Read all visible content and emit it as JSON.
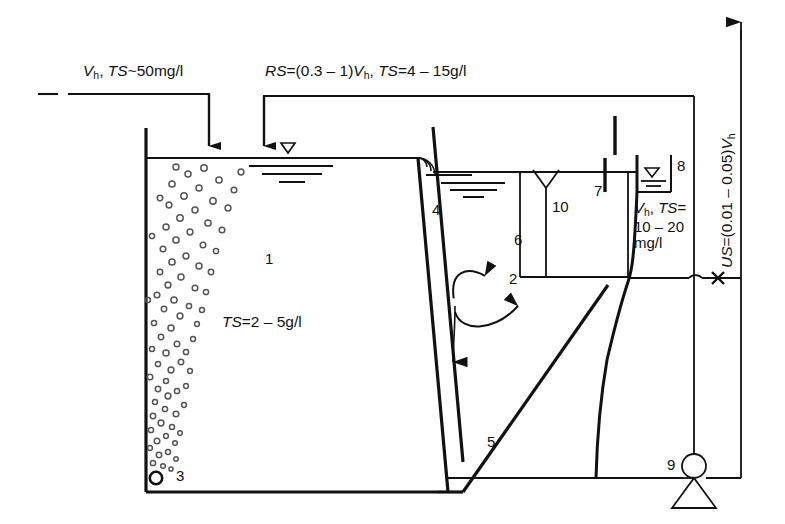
{
  "diagram": {
    "type": "process-flow-schematic",
    "line_color": "#111111",
    "background": "#ffffff"
  },
  "annotations": {
    "influent": {
      "parts": [
        "V",
        "h",
        ", ",
        "TS",
        "~50mg/l"
      ],
      "flow_symbol": "V",
      "flow_sub": "h",
      "sep": ", ",
      "ts_symbol": "TS",
      "ts_value": "~50mg/l"
    },
    "return_sludge": {
      "rs_symbol": "RS",
      "rs_value": "=(0.3 – 1)",
      "flow_symbol": "V",
      "flow_sub": "h",
      "sep": ", ",
      "ts_symbol": "TS",
      "ts_value": "=4 – 15g/l"
    },
    "excess_sludge": {
      "us_symbol": "US",
      "us_value": "=(0.01 – 0.05)",
      "flow_symbol": "V",
      "flow_sub": "h"
    },
    "aeration_ts": {
      "ts_symbol": "TS",
      "ts_value": "=2 – 5g/l"
    },
    "effluent": {
      "flow_symbol": "V",
      "flow_sub": "h",
      "sep": ", ",
      "ts_symbol": "TS",
      "ts_eq": "=",
      "line2": "10 – 20",
      "line3": "mg/l"
    }
  },
  "item_numbers": [
    {
      "id": "1",
      "label": "1"
    },
    {
      "id": "2",
      "label": "2"
    },
    {
      "id": "3",
      "label": "3"
    },
    {
      "id": "4",
      "label": "4"
    },
    {
      "id": "5",
      "label": "5"
    },
    {
      "id": "6",
      "label": "6"
    },
    {
      "id": "7",
      "label": "7"
    },
    {
      "id": "8",
      "label": "8"
    },
    {
      "id": "9",
      "label": "9"
    },
    {
      "id": "10",
      "label": "10"
    }
  ]
}
